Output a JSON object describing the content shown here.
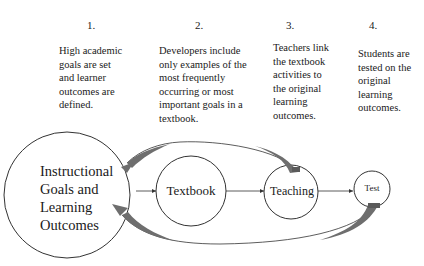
{
  "steps": [
    {
      "number": "1.",
      "text": "High academic\ngoals are set\nand learner\noutcomes are\ndefined."
    },
    {
      "number": "2.",
      "text": "Developers include\nonly examples of the\nmost frequently\noccurring or most\nimportant goals in a\ntextbook."
    },
    {
      "number": "3.",
      "text": "Teachers link\nthe textbook\nactivities to\nthe original\nlearning\noutcomes."
    },
    {
      "number": "4.",
      "text": "Students are\ntested on the\noriginal\nlearning\noutcomes."
    }
  ],
  "nodes": {
    "goals": "Instructional\nGoals and\nLearning\nOutcomes",
    "textbook": "Textbook",
    "teaching": "Teaching",
    "test": "Test"
  },
  "colors": {
    "stroke": "#333333",
    "feedback_arrow": "#6e6e6e"
  }
}
